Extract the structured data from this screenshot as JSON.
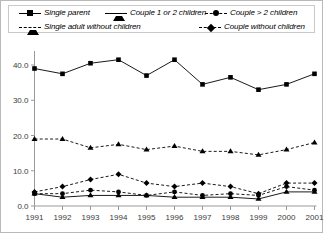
{
  "legend": {
    "entries": [
      {
        "label": "Single parent",
        "marker": "square",
        "line": "solid",
        "row": 1
      },
      {
        "label": "Couple 1 or 2 children",
        "marker": "triangle",
        "line": "solid",
        "row": 1
      },
      {
        "label": "Couple > 2 children",
        "marker": "circle",
        "line": "dashed",
        "row": 1
      },
      {
        "label": "Single adult without children",
        "marker": "triangle",
        "line": "dashed",
        "row": 2
      },
      {
        "label": "Couple without children",
        "marker": "diamond",
        "line": "dashed",
        "row": 2
      }
    ]
  },
  "axes": {
    "y_ticks": [
      "0.0",
      "10.0",
      "20.0",
      "30.0",
      "40.0"
    ],
    "x_ticks": [
      "1991",
      "1992",
      "1993",
      "1994",
      "1995",
      "1996",
      "1997",
      "1998",
      "1999",
      "2000",
      "2001"
    ]
  },
  "chart_data": {
    "type": "line",
    "title": "",
    "xlabel": "",
    "ylabel": "",
    "grid": false,
    "legend_position": "top",
    "x": [
      1991,
      1992,
      1993,
      1994,
      1995,
      1996,
      1997,
      1998,
      1999,
      2000,
      2001
    ],
    "xlim": [
      1991,
      2001
    ],
    "ylim": [
      0,
      45
    ],
    "y_tick_values": [
      0.0,
      10.0,
      20.0,
      30.0,
      40.0
    ],
    "series": [
      {
        "name": "Single parent",
        "marker": "square",
        "line": "solid",
        "color": "#000000",
        "values": [
          39.0,
          37.5,
          40.5,
          41.5,
          37.0,
          41.5,
          34.5,
          36.5,
          33.0,
          34.5,
          37.5
        ]
      },
      {
        "name": "Single adult without children",
        "marker": "triangle",
        "line": "dashed",
        "color": "#000000",
        "values": [
          19.0,
          19.0,
          16.5,
          17.5,
          16.0,
          17.0,
          15.5,
          15.5,
          14.5,
          16.0,
          18.0
        ]
      },
      {
        "name": "Couple without children",
        "marker": "diamond",
        "line": "dashed",
        "color": "#000000",
        "values": [
          4.0,
          5.5,
          7.5,
          9.0,
          6.5,
          5.5,
          6.5,
          5.5,
          3.5,
          6.5,
          6.5
        ]
      },
      {
        "name": "Couple > 2 children",
        "marker": "circle",
        "line": "dashed",
        "color": "#000000",
        "values": [
          3.5,
          3.5,
          4.5,
          4.0,
          3.0,
          4.0,
          3.0,
          3.5,
          3.0,
          5.5,
          4.5
        ]
      },
      {
        "name": "Couple 1 or 2 children",
        "marker": "triangle",
        "line": "solid",
        "color": "#000000",
        "values": [
          3.5,
          2.5,
          3.0,
          3.0,
          3.0,
          2.5,
          2.5,
          2.5,
          2.0,
          4.0,
          4.0
        ]
      }
    ]
  }
}
